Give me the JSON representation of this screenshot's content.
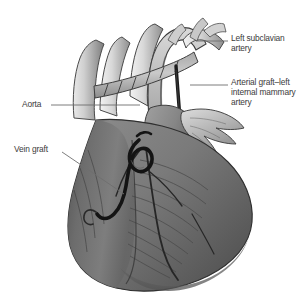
{
  "figure": {
    "type": "anatomical-illustration",
    "style": "grayscale medical line-and-wash drawing",
    "background_color": "#ffffff",
    "ink_color": "#3b3b3b",
    "leader_color": "#6e6e6e"
  },
  "labels": [
    {
      "id": "left-subclavian-artery",
      "text": "Left subclavian\nartery",
      "position": "top-right",
      "leader": "horizontal line from label left edge to vessel at upper right of aortic arch"
    },
    {
      "id": "arterial-graft-lima",
      "text": "Arterial graft–left\ninternal mammary\nartery",
      "position": "right",
      "leader": "horizontal line from label left edge to dark graft vessel"
    },
    {
      "id": "aorta",
      "text": "Aorta",
      "position": "left",
      "leader": "horizontal line from label right edge to ascending aorta"
    },
    {
      "id": "vein-graft",
      "text": "Vein graft",
      "position": "left",
      "leader": "diagonal line from label down-right to looping dark vein graft on ventricle"
    }
  ],
  "anatomy": {
    "structures": [
      "aortic arch",
      "ascending aorta",
      "left subclavian artery",
      "brachiocephalic vessels",
      "superior vena cava",
      "right atrial appendage",
      "left ventricle",
      "right ventricle",
      "cardiac apex",
      "coronary arteries"
    ],
    "grafts": [
      "arterial graft – left internal mammary artery",
      "vein graft"
    ],
    "suture_marks": "hatch marks along the arterial graft anastomosis"
  },
  "palette": {
    "myocardium_dark": "#5a5a5a",
    "myocardium_mid": "#8a8a8a",
    "vessel_light": "#cfcfcf",
    "vessel_highlight": "#efefef",
    "graft_dark": "#1c1c1c",
    "outline": "#2e2e2e"
  }
}
